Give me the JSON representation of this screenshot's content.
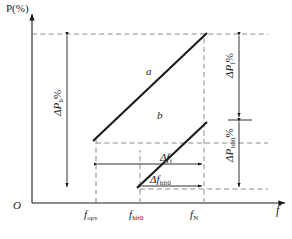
{
  "figure": {
    "axes": {
      "y_label": "P(%)",
      "x_label": "f",
      "origin_label": "O"
    },
    "x_ticks": [
      {
        "id": "opv",
        "base": "f",
        "sub": "opv"
      },
      {
        "id": "hft0",
        "base": "f",
        "sub": "hft0"
      },
      {
        "id": "n",
        "base": "f",
        "sub": "N"
      }
    ],
    "curves": [
      {
        "id": "a",
        "label": "a"
      },
      {
        "id": "b",
        "label": "b"
      }
    ],
    "annotations": {
      "delta_p_b": {
        "base": "ΔP",
        "sub": "b",
        "unit": "%"
      },
      "delta_p_f": {
        "base": "ΔP",
        "sub": "f",
        "unit": "%"
      },
      "delta_p_hft0": {
        "base": "ΔP",
        "sub": "hft0",
        "unit": "%"
      },
      "delta_f_f": {
        "base": "Δf",
        "sub": "f"
      },
      "delta_f_hft0": {
        "base": "Δf",
        "sub": "hft0"
      }
    },
    "colors": {
      "line": "#1a1a1a",
      "dashed": "#7d7d7d",
      "background": "#ffffff"
    }
  }
}
